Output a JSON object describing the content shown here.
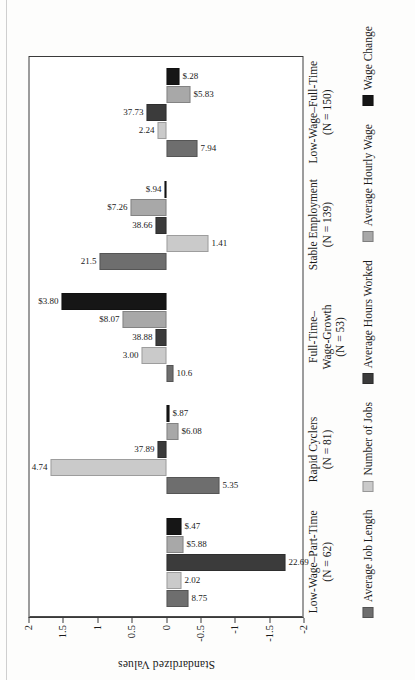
{
  "chart_data": {
    "type": "bar",
    "orientation": "rotated-90",
    "title": "",
    "xlabel": "",
    "ylabel": "Standardized Values",
    "ylim": [
      -2,
      2
    ],
    "yticks": [
      "2",
      "1.5",
      "1",
      "0.5",
      "0",
      "-0.5",
      "-1",
      "-1.5",
      "-2"
    ],
    "ytick_values": [
      2,
      1.5,
      1,
      0.5,
      0,
      -0.5,
      -1,
      -1.5,
      -2
    ],
    "grid": false,
    "legend_position": "bottom",
    "categories": [
      "Low-Wage–Part-Time",
      "Rapid Cyclers",
      "Full-Time–\nWage-Growth",
      "Stable Employment",
      "Low-Wage–Full-Time"
    ],
    "category_counts": [
      "(N = 62)",
      "(N = 81)",
      "(N = 53)",
      "(N = 139)",
      "(N = 150)"
    ],
    "series": [
      {
        "name": "Average Job Length",
        "color": "#6e6e6e",
        "values": [
          -0.32,
          -0.78,
          -0.11,
          0.97,
          -0.46
        ],
        "labels": [
          "8.75",
          "5.35",
          "10.6",
          "21.5",
          "7.94"
        ]
      },
      {
        "name": "Number of Jobs",
        "color": "#cacaca",
        "values": [
          -0.22,
          1.68,
          0.35,
          -0.62,
          0.12
        ],
        "labels": [
          "2.02",
          "4.74",
          "3.00",
          "1.41",
          "2.24"
        ]
      },
      {
        "name": "Average Hours Worked",
        "color": "#3b3b3b",
        "values": [
          -1.74,
          0.13,
          0.16,
          0.16,
          0.28
        ],
        "labels": [
          "22.69",
          "37.89",
          "38.88",
          "38.66",
          "37.73"
        ]
      },
      {
        "name": "Average Hourly Wage",
        "color": "#a8a8a8",
        "values": [
          -0.26,
          -0.18,
          0.64,
          0.52,
          -0.36
        ],
        "labels": [
          "$5.88",
          "$6.08",
          "$8.07",
          "$7.26",
          "$5.83"
        ]
      },
      {
        "name": "Wage Change",
        "color": "#161616",
        "values": [
          -0.22,
          -0.05,
          1.52,
          0.02,
          -0.2
        ],
        "labels": [
          "$.47",
          "$.87",
          "$3.80",
          "$.94",
          "$.28"
        ]
      }
    ]
  }
}
